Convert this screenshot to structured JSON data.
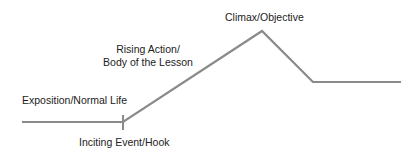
{
  "diagram": {
    "type": "plot-structure-line",
    "line_color": "#8a8a8a",
    "labels": {
      "climax": "Climax/Objective",
      "rising_line1": "Rising Action/",
      "rising_line2": "Body of the Lesson",
      "exposition": "Exposition/Normal Life",
      "inciting": "Inciting Event/Hook"
    },
    "points": [
      {
        "x": 22,
        "y": 122
      },
      {
        "x": 123,
        "y": 122
      },
      {
        "x": 262,
        "y": 31
      },
      {
        "x": 313,
        "y": 82
      },
      {
        "x": 401,
        "y": 82
      }
    ],
    "tick": {
      "x": 123,
      "y1": 115,
      "y2": 130
    }
  }
}
